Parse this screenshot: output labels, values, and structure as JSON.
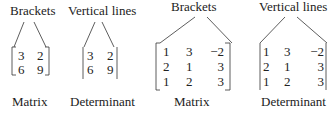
{
  "small": {
    "matrix": {
      "top_label": "Brackets",
      "bottom_label": "Matrix",
      "rows": [
        [
          "3",
          "2"
        ],
        [
          "6",
          "9"
        ]
      ]
    },
    "determinant": {
      "top_label": "Vertical lines",
      "bottom_label": "Determinant",
      "rows": [
        [
          "3",
          "2"
        ],
        [
          "6",
          "9"
        ]
      ]
    }
  },
  "large": {
    "matrix": {
      "top_label": "Brackets",
      "bottom_label": "Matrix",
      "rows": [
        [
          "1",
          "3",
          "−2"
        ],
        [
          "2",
          "1",
          "3"
        ],
        [
          "1",
          "2",
          "3"
        ]
      ]
    },
    "determinant": {
      "top_label": "Vertical lines",
      "bottom_label": "Determinant",
      "rows": [
        [
          "1",
          "3",
          "−2"
        ],
        [
          "2",
          "1",
          "3"
        ],
        [
          "1",
          "2",
          "3"
        ]
      ]
    }
  }
}
